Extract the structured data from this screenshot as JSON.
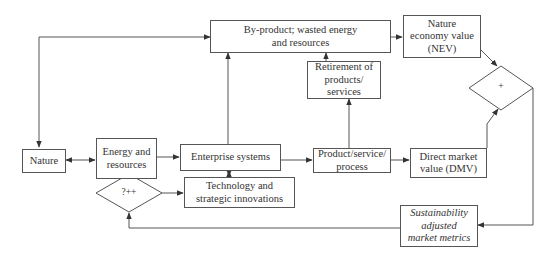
{
  "diagram": {
    "type": "flowchart",
    "nodes": {
      "nature": "Nature",
      "energy": "Energy and resources",
      "enterprise": "Enterprise systems",
      "byproduct": "By-product; wasted energy and resources",
      "nev": "Nature economy value (NEV)",
      "retirement": "Retirement of products/ services",
      "product": "Product/service/ process",
      "dmv": "Direct market value (DMV)",
      "plus_decision": "+",
      "qpp_decision": "?++",
      "technology": "Technology and strategic innovations",
      "sustainability": "Sustainability adjusted market metrics"
    },
    "node_lines": {
      "energy": [
        "Energy and",
        "resources"
      ],
      "byproduct": [
        "By-product; wasted energy",
        "and resources"
      ],
      "nev": [
        "Nature",
        "economy value",
        "(NEV)"
      ],
      "retirement": [
        "Retirement of",
        "products/",
        "services"
      ],
      "product": [
        "Product/service/",
        "process"
      ],
      "dmv": [
        "Direct market",
        "value (DMV)"
      ],
      "technology": [
        "Technology and",
        "strategic innovations"
      ],
      "sustainability": [
        "Sustainability",
        "adjusted",
        "market metrics"
      ]
    },
    "edges": [
      {
        "from": "nature",
        "to": "energy",
        "bidirectional": true
      },
      {
        "from": "energy",
        "to": "enterprise"
      },
      {
        "from": "enterprise",
        "to": "byproduct"
      },
      {
        "from": "byproduct",
        "to": "nature"
      },
      {
        "from": "enterprise",
        "to": "product"
      },
      {
        "from": "product",
        "to": "retirement"
      },
      {
        "from": "retirement",
        "to": "byproduct"
      },
      {
        "from": "byproduct",
        "to": "nev"
      },
      {
        "from": "product",
        "to": "dmv"
      },
      {
        "from": "nev",
        "to": "plus_decision"
      },
      {
        "from": "dmv",
        "to": "plus_decision"
      },
      {
        "from": "plus_decision",
        "to": "sustainability"
      },
      {
        "from": "sustainability",
        "to": "qpp_decision"
      },
      {
        "from": "energy",
        "to": "qpp_decision",
        "bidirectional": true
      },
      {
        "from": "qpp_decision",
        "to": "technology"
      },
      {
        "from": "enterprise",
        "to": "technology",
        "bidirectional": true
      }
    ],
    "colors": {
      "line": "#444444",
      "box_border": "#555555",
      "text": "#333333"
    }
  }
}
